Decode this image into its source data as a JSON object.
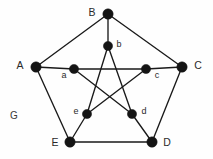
{
  "figure": {
    "name_label": "G",
    "name_label_pos": {
      "x": 14,
      "y": 116
    },
    "background_color": "#fefefe",
    "edge_color": "#1a1a1a",
    "node_color": "#141414",
    "label_color": "#2a2a2a"
  },
  "chart_data": {
    "type": "diagram",
    "title": "G",
    "nodes": [
      {
        "id": "A",
        "label": "A",
        "x": 36,
        "y": 67,
        "r": 5.2,
        "ring": "outer",
        "label_x": 20,
        "label_y": 66,
        "label_anchor": "middle"
      },
      {
        "id": "B",
        "label": "B",
        "x": 108,
        "y": 14,
        "r": 5.2,
        "ring": "outer",
        "label_x": 92,
        "label_y": 13,
        "label_anchor": "middle"
      },
      {
        "id": "C",
        "label": "C",
        "x": 182,
        "y": 67,
        "r": 5.2,
        "ring": "outer",
        "label_x": 198,
        "label_y": 66,
        "label_anchor": "middle"
      },
      {
        "id": "D",
        "label": "D",
        "x": 152,
        "y": 142,
        "r": 5.2,
        "ring": "outer",
        "label_x": 167,
        "label_y": 143,
        "label_anchor": "middle"
      },
      {
        "id": "E",
        "label": "E",
        "x": 70,
        "y": 142,
        "r": 5.2,
        "ring": "outer",
        "label_x": 55,
        "label_y": 143,
        "label_anchor": "middle"
      },
      {
        "id": "a",
        "label": "a",
        "x": 74,
        "y": 69,
        "r": 4.6,
        "ring": "inner",
        "label_x": 64,
        "label_y": 76,
        "label_anchor": "middle"
      },
      {
        "id": "b",
        "label": "b",
        "x": 108,
        "y": 46,
        "r": 4.6,
        "ring": "inner",
        "label_x": 119,
        "label_y": 45,
        "label_anchor": "middle"
      },
      {
        "id": "c",
        "label": "c",
        "x": 146,
        "y": 69,
        "r": 4.6,
        "ring": "inner",
        "label_x": 157,
        "label_y": 76,
        "label_anchor": "middle"
      },
      {
        "id": "d",
        "label": "d",
        "x": 132,
        "y": 114,
        "r": 4.6,
        "ring": "inner",
        "label_x": 144,
        "label_y": 112,
        "label_anchor": "middle"
      },
      {
        "id": "e",
        "label": "e",
        "x": 87,
        "y": 114,
        "r": 4.6,
        "ring": "inner",
        "label_x": 76,
        "label_y": 112,
        "label_anchor": "middle"
      }
    ],
    "edges": [
      {
        "from": "A",
        "to": "B",
        "kind": "outer-cycle"
      },
      {
        "from": "B",
        "to": "C",
        "kind": "outer-cycle"
      },
      {
        "from": "C",
        "to": "D",
        "kind": "outer-cycle"
      },
      {
        "from": "D",
        "to": "E",
        "kind": "outer-cycle"
      },
      {
        "from": "E",
        "to": "A",
        "kind": "outer-cycle"
      },
      {
        "from": "A",
        "to": "a",
        "kind": "spoke"
      },
      {
        "from": "B",
        "to": "b",
        "kind": "spoke"
      },
      {
        "from": "C",
        "to": "c",
        "kind": "spoke"
      },
      {
        "from": "D",
        "to": "d",
        "kind": "spoke"
      },
      {
        "from": "E",
        "to": "e",
        "kind": "spoke"
      },
      {
        "from": "a",
        "to": "c",
        "kind": "pentagram"
      },
      {
        "from": "c",
        "to": "e",
        "kind": "pentagram"
      },
      {
        "from": "e",
        "to": "b",
        "kind": "pentagram"
      },
      {
        "from": "b",
        "to": "d",
        "kind": "pentagram"
      },
      {
        "from": "d",
        "to": "a",
        "kind": "pentagram"
      }
    ]
  }
}
